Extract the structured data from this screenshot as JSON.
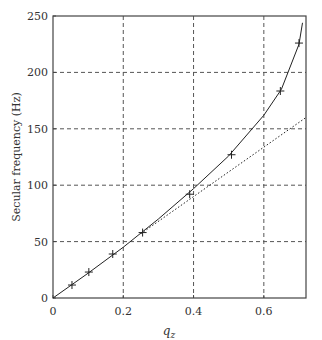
{
  "chart_data": {
    "type": "line",
    "title": "",
    "xlabel": "q_z",
    "ylabel": "Secular frequency (Hz)",
    "xlim": [
      0,
      0.72
    ],
    "ylim": [
      0,
      250
    ],
    "xticks": [
      0,
      0.2,
      0.4,
      0.6
    ],
    "xtick_labels": [
      "0",
      "0.2",
      "0.4",
      "0.6"
    ],
    "yticks": [
      0,
      50,
      100,
      150,
      200,
      250
    ],
    "ytick_labels": [
      "0",
      "50",
      "100",
      "150",
      "200",
      "250"
    ],
    "grid": true,
    "series": [
      {
        "name": "exact (solid)",
        "style": "solid",
        "x": [
          0,
          0.1,
          0.2,
          0.3,
          0.4,
          0.5,
          0.6,
          0.65,
          0.7,
          0.71
        ],
        "y": [
          0,
          22,
          45,
          70,
          97,
          126,
          162,
          185,
          225,
          244
        ]
      },
      {
        "name": "approximation (dotted)",
        "style": "dotted",
        "x": [
          0.25,
          0.72
        ],
        "y": [
          57,
          160
        ]
      },
      {
        "name": "measured",
        "style": "markers",
        "marker": "+",
        "x": [
          0.054,
          0.102,
          0.17,
          0.255,
          0.389,
          0.508,
          0.647,
          0.7
        ],
        "y": [
          11.5,
          23,
          39,
          58,
          92,
          127,
          183.5,
          226
        ]
      }
    ]
  }
}
